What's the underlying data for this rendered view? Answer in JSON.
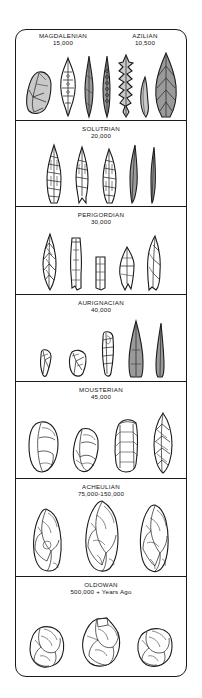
{
  "figure": {
    "kind": "stone-tool-typology-chart",
    "orientation": "vertical-stack-newest-top"
  },
  "panels": [
    {
      "id": "magdalenian-azilian",
      "split": true,
      "left": {
        "name": "MAGDALENIAN",
        "date": "15,000"
      },
      "right": {
        "name": "AZILIAN",
        "date": "10,500"
      },
      "tool_count": 6,
      "tool_names": [
        "end-scraper-flake",
        "bifacial-leaf-point",
        "backed-blade",
        "denticulated-blade",
        "barbed-harpoon-point",
        "curved-microlith",
        "laurel-leaf-point"
      ]
    },
    {
      "id": "solutrian",
      "split": false,
      "name": "SOLUTRIAN",
      "date": "20,000",
      "tool_count": 5,
      "tool_names": [
        "willow-leaf-point",
        "shouldered-point",
        "laurel-leaf-point",
        "long-blade",
        "narrow-bladelet"
      ]
    },
    {
      "id": "perigordian",
      "split": false,
      "name": "PERIGORDIAN",
      "date": "30,000",
      "tool_count": 5,
      "tool_names": [
        "retouched-leaf-blade",
        "truncated-blade",
        "rectangular-blade-segment",
        "gravette-point",
        "backed-knife-blade"
      ]
    },
    {
      "id": "aurignacian",
      "split": false,
      "name": "AURIGNACIAN",
      "date": "40,000",
      "tool_count": 5,
      "tool_names": [
        "small-end-scraper",
        "nosed-scraper",
        "steep-core-scraper",
        "broad-leaf-point",
        "narrow-point-blade"
      ]
    },
    {
      "id": "mousterian",
      "split": false,
      "name": "MOUSTERIAN",
      "date": "45,000",
      "tool_count": 4,
      "tool_names": [
        "discoid-core",
        "side-scraper",
        "transverse-scraper",
        "bifacial-oval-point"
      ]
    },
    {
      "id": "acheulian",
      "split": false,
      "name": "ACHEULIAN",
      "date": "75,000-150,000",
      "tool_count": 3,
      "tool_names": [
        "cleaver-handaxe",
        "pointed-handaxe",
        "ovate-handaxe"
      ]
    },
    {
      "id": "oldowan",
      "split": false,
      "name": "OLDOWAN",
      "date": "500,000 +   Years Ago",
      "tool_count": 3,
      "tool_names": [
        "chopper-core-left",
        "chopper-core-center",
        "chopper-core-right"
      ]
    }
  ],
  "colors": {
    "outline": "#1b1b1b",
    "fill_light": "#ffffff",
    "fill_mid": "#c9c9c9",
    "fill_dark": "#9a9a9a",
    "page_background": "#ffffff"
  }
}
